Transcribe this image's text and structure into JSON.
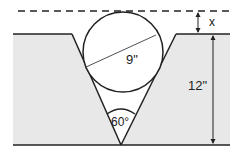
{
  "diagram": {
    "labels": {
      "x": "x",
      "diameter": "9\"",
      "depth": "12\"",
      "angle": "60°"
    },
    "colors": {
      "fill": "#e8e8e8",
      "stroke": "#222222",
      "background": "#ffffff"
    }
  }
}
